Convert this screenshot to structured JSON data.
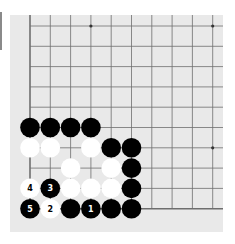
{
  "diagram": {
    "type": "go-board-corner",
    "corner": "bottom-left",
    "grid": {
      "columns_visible": 10,
      "rows_visible": 10,
      "origin_x": 30,
      "origin_y": 26,
      "spacing": 20.3
    },
    "colors": {
      "page": "#ffffff",
      "board": "#e9e9e9",
      "line": "#6e6e6e",
      "black_stone": "#000000",
      "white_stone": "#ffffff",
      "side_bar": "#8a8a8a"
    },
    "star_points": [
      {
        "col": 3,
        "row": 0
      },
      {
        "col": 9,
        "row": 0
      },
      {
        "col": 9,
        "row": 6
      }
    ],
    "stones": [
      {
        "color": "black",
        "col": 0,
        "row": 5,
        "label": ""
      },
      {
        "color": "black",
        "col": 1,
        "row": 5,
        "label": ""
      },
      {
        "color": "black",
        "col": 2,
        "row": 5,
        "label": ""
      },
      {
        "color": "black",
        "col": 3,
        "row": 5,
        "label": ""
      },
      {
        "color": "white",
        "col": 0,
        "row": 6,
        "label": ""
      },
      {
        "color": "white",
        "col": 1,
        "row": 6,
        "label": ""
      },
      {
        "color": "white",
        "col": 3,
        "row": 6,
        "label": ""
      },
      {
        "color": "black",
        "col": 4,
        "row": 6,
        "label": ""
      },
      {
        "color": "black",
        "col": 5,
        "row": 6,
        "label": ""
      },
      {
        "color": "white",
        "col": 2,
        "row": 7,
        "label": ""
      },
      {
        "color": "white",
        "col": 4,
        "row": 7,
        "label": ""
      },
      {
        "color": "black",
        "col": 5,
        "row": 7,
        "label": ""
      },
      {
        "color": "white",
        "col": 0,
        "row": 8,
        "label": "4"
      },
      {
        "color": "black",
        "col": 1,
        "row": 8,
        "label": "3"
      },
      {
        "color": "white",
        "col": 2,
        "row": 8,
        "label": ""
      },
      {
        "color": "white",
        "col": 3,
        "row": 8,
        "label": ""
      },
      {
        "color": "white",
        "col": 4,
        "row": 8,
        "label": ""
      },
      {
        "color": "black",
        "col": 5,
        "row": 8,
        "label": ""
      },
      {
        "color": "black",
        "col": 0,
        "row": 9,
        "label": "5"
      },
      {
        "color": "white",
        "col": 1,
        "row": 9,
        "label": "2"
      },
      {
        "color": "black",
        "col": 2,
        "row": 9,
        "label": ""
      },
      {
        "color": "black",
        "col": 3,
        "row": 9,
        "label": "1"
      },
      {
        "color": "black",
        "col": 4,
        "row": 9,
        "label": ""
      },
      {
        "color": "black",
        "col": 5,
        "row": 9,
        "label": ""
      }
    ],
    "move_labels": [
      "1",
      "2",
      "3",
      "4",
      "5"
    ]
  }
}
